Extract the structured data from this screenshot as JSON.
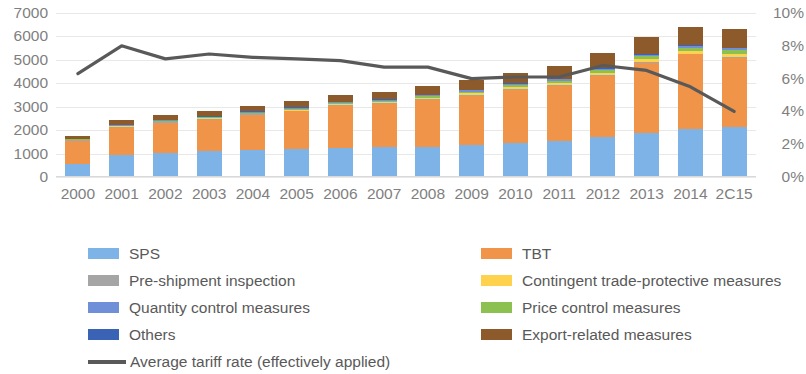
{
  "chart_data": {
    "type": "bar",
    "subtype": "stacked-bar-with-line",
    "title": "",
    "xlabel": "",
    "ylabel": "",
    "categories": [
      "2000",
      "2001",
      "2002",
      "2003",
      "2004",
      "2005",
      "2006",
      "2007",
      "2008",
      "2009",
      "2010",
      "2011",
      "2012",
      "2013",
      "2014",
      "2C15"
    ],
    "ylim": [
      0,
      7000
    ],
    "yticks": [
      "0",
      "1000",
      "2000",
      "3000",
      "4000",
      "5000",
      "6000",
      "7000"
    ],
    "y2lim": [
      0,
      10
    ],
    "y2ticks": [
      "0%",
      "2%",
      "4%",
      "6%",
      "8%",
      "10%"
    ],
    "grid": true,
    "legend_position": "bottom",
    "series": [
      {
        "name": "SPS",
        "color": "#7EB3E8",
        "values": [
          560,
          930,
          1040,
          1130,
          1160,
          1180,
          1230,
          1270,
          1300,
          1380,
          1450,
          1520,
          1700,
          1890,
          2030,
          2150
        ]
      },
      {
        "name": "TBT",
        "color": "#F0944A",
        "values": [
          980,
          1180,
          1270,
          1320,
          1480,
          1620,
          1800,
          1840,
          1990,
          2090,
          2280,
          2370,
          2620,
          2990,
          3200,
          2950
        ]
      },
      {
        "name": "Pre-shipment inspection",
        "color": "#A5A5A5",
        "values": [
          30,
          30,
          30,
          30,
          30,
          30,
          30,
          30,
          30,
          30,
          30,
          35,
          35,
          35,
          35,
          35
        ]
      },
      {
        "name": "Contingent trade-protective measures",
        "color": "#FFD24D",
        "values": [
          20,
          25,
          30,
          35,
          40,
          45,
          50,
          55,
          60,
          70,
          80,
          90,
          100,
          115,
          125,
          130
        ]
      },
      {
        "name": "Price control measures",
        "color": "#8CC152",
        "values": [
          25,
          30,
          35,
          40,
          45,
          50,
          55,
          60,
          70,
          80,
          90,
          100,
          110,
          125,
          135,
          145
        ]
      },
      {
        "name": "Quantity control measures",
        "color": "#6F8FD8",
        "values": [
          20,
          25,
          25,
          30,
          30,
          35,
          35,
          40,
          45,
          50,
          55,
          60,
          65,
          70,
          75,
          80
        ]
      },
      {
        "name": "Others",
        "color": "#3A62B5",
        "values": [
          10,
          12,
          14,
          16,
          18,
          20,
          22,
          24,
          26,
          28,
          30,
          32,
          34,
          36,
          38,
          40
        ]
      },
      {
        "name": "Export-related measures",
        "color": "#8C5A2B",
        "values": [
          100,
          200,
          220,
          230,
          240,
          250,
          290,
          320,
          350,
          410,
          430,
          520,
          630,
          720,
          760,
          780
        ]
      }
    ],
    "line_series": {
      "name": "Average tariff rate (effectively applied)",
      "color": "#595959",
      "unit": "%",
      "values": [
        6.3,
        8.0,
        7.2,
        7.5,
        7.3,
        7.2,
        7.1,
        6.7,
        6.7,
        6.0,
        6.1,
        6.1,
        6.8,
        6.5,
        5.5,
        4.0
      ]
    }
  },
  "axes": {
    "left_ticks": [
      "7000",
      "6000",
      "5000",
      "4000",
      "3000",
      "2000",
      "1000",
      "0"
    ],
    "right_ticks": [
      "10%",
      "8%",
      "6%",
      "4%",
      "2%",
      "0%"
    ],
    "x_ticks": [
      "2000",
      "2001",
      "2002",
      "2003",
      "2004",
      "2005",
      "2006",
      "2007",
      "2008",
      "2009",
      "2010",
      "2011",
      "2012",
      "2013",
      "2014",
      "2C15"
    ]
  },
  "legend": {
    "left_column": [
      {
        "label": "SPS",
        "color": "#7EB3E8",
        "type": "swatch"
      },
      {
        "label": "Pre-shipment inspection",
        "color": "#A5A5A5",
        "type": "swatch"
      },
      {
        "label": "Quantity control measures",
        "color": "#6F8FD8",
        "type": "swatch"
      },
      {
        "label": "Others",
        "color": "#3A62B5",
        "type": "swatch"
      }
    ],
    "right_column": [
      {
        "label": "TBT",
        "color": "#F0944A",
        "type": "swatch"
      },
      {
        "label": "Contingent trade-protective measures",
        "color": "#FFD24D",
        "type": "swatch"
      },
      {
        "label": "Price control measures",
        "color": "#8CC152",
        "type": "swatch"
      },
      {
        "label": "Export-related measures",
        "color": "#8C5A2B",
        "type": "swatch"
      }
    ],
    "line_entry": {
      "label": "Average tariff rate (effectively applied)",
      "color": "#595959",
      "type": "line"
    }
  }
}
